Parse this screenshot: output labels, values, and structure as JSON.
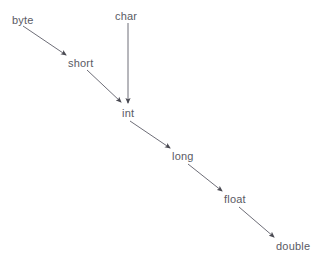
{
  "diagram": {
    "background_color": "#ffffff",
    "text_color": "#5a5a64",
    "arrow_color": "#6e6e78",
    "nodes": [
      {
        "id": "byte",
        "label": "byte",
        "x": 12,
        "y": 14
      },
      {
        "id": "char",
        "label": "char",
        "x": 115,
        "y": 10
      },
      {
        "id": "short",
        "label": "short",
        "x": 68,
        "y": 57
      },
      {
        "id": "int",
        "label": "int",
        "x": 122,
        "y": 107
      },
      {
        "id": "long",
        "label": "long",
        "x": 172,
        "y": 150
      },
      {
        "id": "float",
        "label": "float",
        "x": 224,
        "y": 193
      },
      {
        "id": "double",
        "label": "double",
        "x": 276,
        "y": 240
      }
    ],
    "edges": [
      {
        "id": "byte-to-short",
        "from": "byte",
        "to": "short",
        "x1": 23,
        "y1": 26,
        "x2": 66,
        "y2": 55
      },
      {
        "id": "char-to-int",
        "from": "char",
        "to": "int",
        "x1": 128,
        "y1": 23,
        "x2": 128,
        "y2": 103
      },
      {
        "id": "short-to-int",
        "from": "short",
        "to": "int",
        "x1": 87,
        "y1": 70,
        "x2": 121,
        "y2": 102
      },
      {
        "id": "int-to-long",
        "from": "int",
        "to": "long",
        "x1": 130,
        "y1": 121,
        "x2": 170,
        "y2": 148
      },
      {
        "id": "long-to-float",
        "from": "long",
        "to": "float",
        "x1": 188,
        "y1": 164,
        "x2": 222,
        "y2": 191
      },
      {
        "id": "float-to-double",
        "from": "float",
        "to": "double",
        "x1": 239,
        "y1": 207,
        "x2": 274,
        "y2": 237
      }
    ]
  }
}
